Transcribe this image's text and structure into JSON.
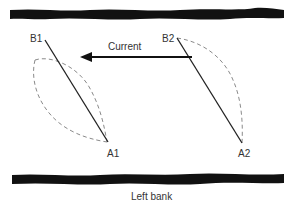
{
  "diagram": {
    "labels": {
      "b1": "B1",
      "a1": "A1",
      "b2": "B2",
      "a2": "A2",
      "current": "Current",
      "left_bank": "Left bank"
    },
    "colors": {
      "bank": "#111111",
      "line": "#222222",
      "dashed": "#8a8a8a",
      "text": "#333333"
    }
  }
}
